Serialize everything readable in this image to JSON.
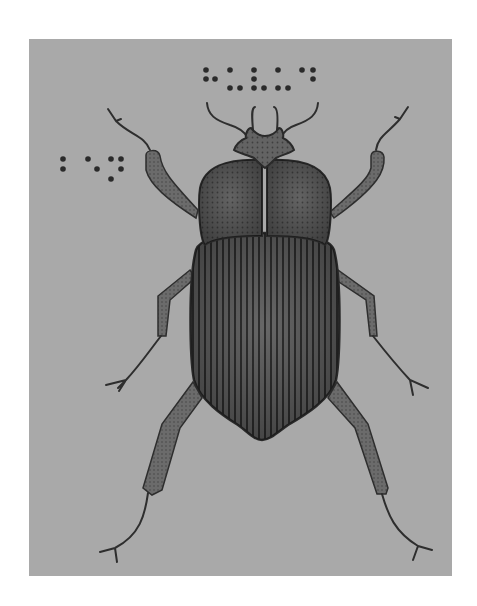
{
  "illustration": {
    "subject": "beetle",
    "style": "tactile graphic with braille labels",
    "colors": {
      "background": "#ffffff",
      "frame": "#a9a9a9",
      "body_fill": "#5e5e5e",
      "body_dark": "#3a3a3a",
      "leg_fill": "#6a6a6a",
      "outline": "#2e2e2e",
      "braille_dot": "#2a2a2a"
    },
    "frame": {
      "x": 29,
      "y": 39,
      "width": 423,
      "height": 537
    },
    "braille_labels": [
      {
        "name": "title-braille",
        "dots": [
          [
            206,
            70
          ],
          [
            230,
            70
          ],
          [
            254,
            70
          ],
          [
            278,
            70
          ],
          [
            302,
            70
          ],
          [
            313,
            70
          ],
          [
            206,
            79
          ],
          [
            215,
            79
          ],
          [
            254,
            79
          ],
          [
            313,
            79
          ],
          [
            230,
            88
          ],
          [
            240,
            88
          ],
          [
            254,
            88
          ],
          [
            264,
            88
          ],
          [
            278,
            88
          ],
          [
            288,
            88
          ]
        ]
      },
      {
        "name": "side-braille",
        "dots": [
          [
            63,
            159
          ],
          [
            88,
            159
          ],
          [
            111,
            159
          ],
          [
            121,
            159
          ],
          [
            63,
            169
          ],
          [
            97,
            169
          ],
          [
            121,
            169
          ],
          [
            111,
            179
          ]
        ]
      }
    ],
    "parts": [
      "antennae",
      "head",
      "elytra-left",
      "elytra-right",
      "abdomen",
      "front-legs",
      "middle-legs",
      "hind-legs"
    ]
  }
}
